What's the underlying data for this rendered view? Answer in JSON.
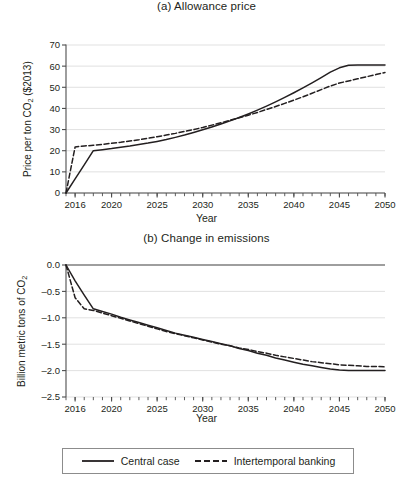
{
  "figure": {
    "xlabel": "Year",
    "legend": {
      "position": "bottom-center",
      "items": [
        {
          "label": "Central case",
          "style": "solid",
          "color": "#231f20"
        },
        {
          "label": "Intertemporal banking",
          "style": "dashed",
          "color": "#231f20"
        }
      ]
    }
  },
  "chart_data": [
    {
      "type": "line",
      "panel": "a",
      "title": "(a) Allowance price",
      "xlabel": "Year",
      "ylabel": "Price per ton CO2 ($2013)",
      "ylabel_parts": {
        "pre": "Price per ton CO",
        "sub": "2",
        "post": " ($2013)"
      },
      "xlim": [
        2015,
        2050
      ],
      "ylim": [
        0,
        70
      ],
      "yticks": [
        0,
        10,
        20,
        30,
        40,
        50,
        60,
        70
      ],
      "xticks_major": [
        2016,
        2020,
        2025,
        2030,
        2035,
        2040,
        2045,
        2050
      ],
      "xticks_minor_step": 1,
      "grid": "horizontal",
      "series": [
        {
          "name": "Central case",
          "style": "solid",
          "color": "#231f20",
          "x": [
            2015,
            2016,
            2017,
            2018,
            2019,
            2020,
            2021,
            2022,
            2023,
            2024,
            2025,
            2026,
            2027,
            2028,
            2029,
            2030,
            2031,
            2032,
            2033,
            2034,
            2035,
            2036,
            2037,
            2038,
            2039,
            2040,
            2041,
            2042,
            2043,
            2044,
            2045,
            2046,
            2047,
            2048,
            2049,
            2050
          ],
          "values": [
            0.0,
            6.7,
            13.3,
            20.0,
            20.5,
            21.0,
            21.6,
            22.2,
            22.9,
            23.6,
            24.4,
            25.3,
            26.3,
            27.4,
            28.6,
            29.9,
            31.2,
            32.6,
            34.1,
            35.7,
            37.4,
            39.2,
            41.1,
            43.1,
            45.2,
            47.4,
            49.7,
            52.1,
            54.6,
            57.2,
            59.2,
            60.4,
            60.5,
            60.5,
            60.5,
            60.5
          ]
        },
        {
          "name": "Intertemporal banking",
          "style": "dashed",
          "color": "#231f20",
          "x": [
            2015,
            2016,
            2017,
            2018,
            2019,
            2020,
            2021,
            2022,
            2023,
            2024,
            2025,
            2026,
            2027,
            2028,
            2029,
            2030,
            2031,
            2032,
            2033,
            2034,
            2035,
            2036,
            2037,
            2038,
            2039,
            2040,
            2041,
            2042,
            2043,
            2044,
            2045,
            2046,
            2047,
            2048,
            2049,
            2050
          ],
          "values": [
            0.0,
            21.8,
            22.2,
            22.6,
            23.0,
            23.5,
            24.0,
            24.6,
            25.2,
            25.9,
            26.6,
            27.4,
            28.2,
            29.1,
            30.0,
            31.0,
            32.1,
            33.2,
            34.4,
            35.6,
            36.8,
            38.1,
            39.5,
            40.9,
            42.4,
            43.9,
            45.5,
            47.2,
            48.9,
            50.6,
            52.0,
            53.0,
            54.0,
            55.0,
            56.0,
            57.0
          ]
        }
      ]
    },
    {
      "type": "line",
      "panel": "b",
      "title": "(b) Change in emissions",
      "xlabel": "Year",
      "ylabel": "Billion metric tons of CO2",
      "ylabel_parts": {
        "pre": "Billion metric tons of CO",
        "sub": "2",
        "post": ""
      },
      "xlim": [
        2015,
        2050
      ],
      "ylim": [
        -2.5,
        0.0
      ],
      "yticks": [
        0.0,
        -0.5,
        -1.0,
        -1.5,
        -2.0,
        -2.5
      ],
      "ytick_labels": [
        "0.0",
        "–0.5",
        "–1.0",
        "–1.5",
        "–2.0",
        "–2.5"
      ],
      "xticks_major": [
        2016,
        2020,
        2025,
        2030,
        2035,
        2040,
        2045,
        2050
      ],
      "xticks_minor_step": 1,
      "grid": "horizontal",
      "series": [
        {
          "name": "Central case",
          "style": "solid",
          "color": "#231f20",
          "x": [
            2015,
            2016,
            2017,
            2018,
            2019,
            2020,
            2021,
            2022,
            2023,
            2024,
            2025,
            2026,
            2027,
            2028,
            2029,
            2030,
            2031,
            2032,
            2033,
            2034,
            2035,
            2036,
            2037,
            2038,
            2039,
            2040,
            2041,
            2042,
            2043,
            2044,
            2045,
            2046,
            2047,
            2048,
            2049,
            2050
          ],
          "values": [
            0.0,
            -0.3,
            -0.57,
            -0.83,
            -0.88,
            -0.93,
            -0.99,
            -1.04,
            -1.09,
            -1.14,
            -1.19,
            -1.24,
            -1.29,
            -1.33,
            -1.37,
            -1.41,
            -1.45,
            -1.49,
            -1.53,
            -1.58,
            -1.62,
            -1.67,
            -1.71,
            -1.76,
            -1.8,
            -1.84,
            -1.88,
            -1.91,
            -1.94,
            -1.97,
            -1.99,
            -2.0,
            -2.0,
            -2.0,
            -2.0,
            -2.0
          ]
        },
        {
          "name": "Intertemporal banking",
          "style": "dashed",
          "color": "#231f20",
          "x": [
            2015,
            2016,
            2017,
            2018,
            2019,
            2020,
            2021,
            2022,
            2023,
            2024,
            2025,
            2026,
            2027,
            2028,
            2029,
            2030,
            2031,
            2032,
            2033,
            2034,
            2035,
            2036,
            2037,
            2038,
            2039,
            2040,
            2041,
            2042,
            2043,
            2044,
            2045,
            2046,
            2047,
            2048,
            2049,
            2050
          ],
          "values": [
            0.0,
            -0.62,
            -0.83,
            -0.86,
            -0.91,
            -0.96,
            -1.01,
            -1.06,
            -1.11,
            -1.16,
            -1.21,
            -1.26,
            -1.3,
            -1.34,
            -1.38,
            -1.42,
            -1.46,
            -1.5,
            -1.53,
            -1.57,
            -1.6,
            -1.64,
            -1.67,
            -1.71,
            -1.74,
            -1.77,
            -1.8,
            -1.83,
            -1.85,
            -1.87,
            -1.89,
            -1.9,
            -1.91,
            -1.92,
            -1.92,
            -1.93
          ]
        }
      ]
    }
  ]
}
